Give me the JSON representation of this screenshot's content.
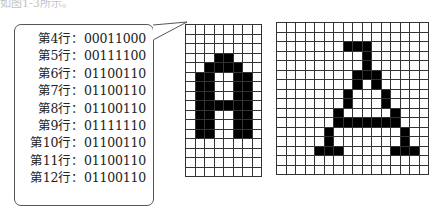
{
  "caption": "如图1-3所示。",
  "bubble": {
    "rows": [
      {
        "label": "第4行：",
        "bits": "00011000"
      },
      {
        "label": "第5行：",
        "bits": "00111100"
      },
      {
        "label": "第6行：",
        "bits": "01100110"
      },
      {
        "label": "第7行：",
        "bits": "01100110"
      },
      {
        "label": "第8行：",
        "bits": "01100110"
      },
      {
        "label": "第9行：",
        "bits": "01111110"
      },
      {
        "label": "第10行：",
        "bits": "01100110"
      },
      {
        "label": "第11行：",
        "bits": "01100110"
      },
      {
        "label": "第12行：",
        "bits": "01100110"
      }
    ]
  },
  "left_grid": {
    "cols": 8,
    "rows": 16,
    "cell": 9.5,
    "bitmap": [
      "00000000",
      "00000000",
      "00000000",
      "00011000",
      "00111100",
      "01100110",
      "01100110",
      "01100110",
      "01111110",
      "01100110",
      "01100110",
      "01100110",
      "00000000",
      "00000000",
      "00000000",
      "00000000"
    ]
  },
  "right_grid": {
    "cols": 16,
    "rows": 16,
    "cell": 9.5,
    "bitmap": [
      "0000000000000000",
      "0000000000000000",
      "0000000111000000",
      "0000000001000000",
      "0000000001000000",
      "0000000011100000",
      "0000000010100000",
      "0000000100010000",
      "0000000100010000",
      "0000001000001000",
      "0000001111111000",
      "0000010000000100",
      "0000010000000100",
      "0000111000001110",
      "0000000000000000",
      "0000000000000000"
    ]
  },
  "colors": {
    "ink": "#000000",
    "grid": "#333333",
    "bg": "#ffffff"
  }
}
